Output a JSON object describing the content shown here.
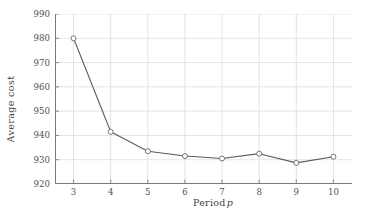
{
  "chart_data": {
    "type": "line",
    "title": "",
    "subtitle": "",
    "xlabel": "Period",
    "xlabel_italic_symbol": "p",
    "ylabel": "Average cost",
    "x": [
      3,
      4,
      5,
      6,
      7,
      8,
      9,
      10
    ],
    "values": [
      980.0,
      941.5,
      933.5,
      931.5,
      930.5,
      932.5,
      928.7,
      931.2
    ],
    "series": [
      {
        "name": "Average cost",
        "values": [
          980.0,
          941.5,
          933.5,
          931.5,
          930.5,
          932.5,
          928.7,
          931.2
        ]
      }
    ],
    "xlim": [
      2.5,
      10.5
    ],
    "ylim": [
      920,
      990
    ],
    "xticks": [
      3,
      4,
      5,
      6,
      7,
      8,
      9,
      10
    ],
    "xtick_labels": [
      "3",
      "4",
      "5",
      "6",
      "7",
      "8",
      "9",
      "10"
    ],
    "yticks": [
      920,
      930,
      940,
      950,
      960,
      970,
      980,
      990
    ],
    "ytick_labels": [
      "920",
      "930",
      "940",
      "950",
      "960",
      "970",
      "980",
      "990"
    ],
    "grid": true,
    "grid_color": "#d9d9d9",
    "legend": null,
    "legend_position": "none",
    "annotations": [],
    "line_color": "#595959",
    "marker": "circle-open",
    "marker_edge_color": "#6e6e6e",
    "marker_face_color": "#ffffff",
    "background_color": "#ffffff",
    "axis_color": "#7a7a7a"
  }
}
